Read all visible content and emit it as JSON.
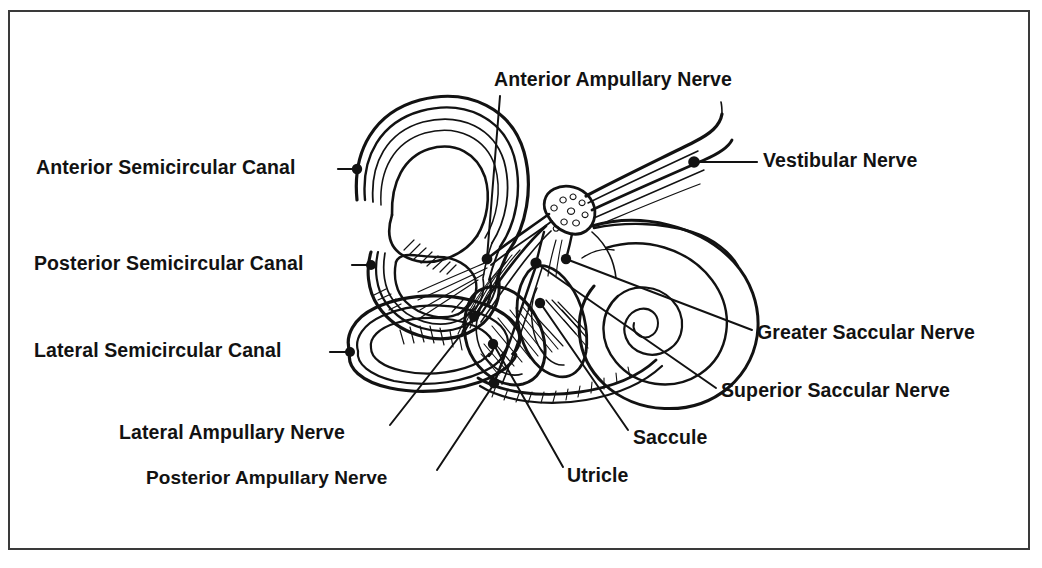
{
  "figure": {
    "kind": "anatomical-line-diagram",
    "width": 1042,
    "height": 568,
    "background_color": "#ffffff",
    "ink_color": "#121212",
    "frame_color": "#3a3a3a"
  },
  "labels": [
    {
      "id": "anterior-semicircular-canal",
      "text": "Anterior Semicircular Canal",
      "align": "right",
      "text_x": 338,
      "text_y": 169,
      "leader": {
        "from_x": 344,
        "from_y": 169,
        "to_x": 356,
        "to_y": 169,
        "dot_x": 357,
        "dot_y": 169
      }
    },
    {
      "id": "posterior-semicircular-canal",
      "text": "Posterior Semicircular Canal",
      "align": "right",
      "text_x": 352,
      "text_y": 265,
      "leader": {
        "from_x": 357,
        "from_y": 265,
        "to_x": 370,
        "to_y": 265,
        "dot_x": 371,
        "dot_y": 265
      }
    },
    {
      "id": "lateral-semicircular-canal",
      "text": "Lateral Semicircular Canal",
      "align": "right",
      "text_x": 330,
      "text_y": 352,
      "leader": {
        "from_x": 335,
        "from_y": 352,
        "to_x": 349,
        "to_y": 352,
        "dot_x": 350,
        "dot_y": 352
      }
    },
    {
      "id": "anterior-ampullary-nerve",
      "text": "Anterior Ampullary Nerve",
      "align": "left",
      "text_x": 494,
      "text_y": 82,
      "leader": {
        "from_x": 500,
        "from_y": 96,
        "to_x": 487,
        "to_y": 258,
        "dot_x": 487,
        "dot_y": 259
      }
    },
    {
      "id": "vestibular-nerve",
      "text": "Vestibular Nerve",
      "align": "left",
      "text_x": 763,
      "text_y": 162,
      "leader": {
        "from_x": 755,
        "from_y": 162,
        "to_x": 700,
        "to_y": 162,
        "dot_x": 694,
        "dot_y": 162
      }
    },
    {
      "id": "greater-saccular-nerve",
      "text": "Greater Saccular Nerve",
      "align": "left",
      "text_x": 757,
      "text_y": 334,
      "leader": {
        "from_x": 750,
        "from_y": 330,
        "to_x": 566,
        "to_y": 259,
        "dot_x": 566,
        "dot_y": 259
      }
    },
    {
      "id": "superior-saccular-nerve",
      "text": "Superior Saccular Nerve",
      "align": "left",
      "text_x": 721,
      "text_y": 392,
      "leader": {
        "from_x": 714,
        "from_y": 388,
        "to_x": 536,
        "to_y": 263,
        "dot_x": 536,
        "dot_y": 263
      }
    },
    {
      "id": "saccule",
      "text": "Saccule",
      "align": "left",
      "text_x": 633,
      "text_y": 439,
      "leader": {
        "from_x": 628,
        "from_y": 430,
        "to_x": 541,
        "to_y": 304,
        "dot_x": 540,
        "dot_y": 303
      }
    },
    {
      "id": "utricle",
      "text": "Utricle",
      "align": "left",
      "text_x": 567,
      "text_y": 477,
      "leader": {
        "from_x": 563,
        "from_y": 467,
        "to_x": 494,
        "to_y": 345,
        "dot_x": 493,
        "dot_y": 344
      }
    },
    {
      "id": "lateral-ampullary-nerve",
      "text": "Lateral Ampullary Nerve",
      "align": "right",
      "text_x": 381,
      "text_y": 434,
      "leader": {
        "from_x": 390,
        "from_y": 425,
        "to_x": 474,
        "to_y": 318,
        "dot_x": 474,
        "dot_y": 317
      }
    },
    {
      "id": "posterior-ampullary-nerve",
      "text": "Posterior Ampullary Nerve",
      "align": "right",
      "text_x": 428,
      "text_y": 479,
      "leader": {
        "from_x": 437,
        "from_y": 470,
        "to_x": 494,
        "to_y": 384,
        "dot_x": 494,
        "dot_y": 383
      }
    }
  ],
  "structures": [
    {
      "id": "anterior-semicircular-canal-loop",
      "name": "Anterior semicircular canal"
    },
    {
      "id": "posterior-semicircular-canal-loop",
      "name": "Posterior semicircular canal"
    },
    {
      "id": "lateral-semicircular-canal-loop",
      "name": "Lateral semicircular canal"
    },
    {
      "id": "cochlea-spiral",
      "name": "Cochlea"
    },
    {
      "id": "vestibular-nerve-trunk",
      "name": "Vestibular nerve trunk"
    },
    {
      "id": "utricle-sac",
      "name": "Utricle"
    },
    {
      "id": "saccule-sac",
      "name": "Saccule"
    },
    {
      "id": "vestibular-ganglion",
      "name": "Scarpa's ganglion"
    }
  ]
}
